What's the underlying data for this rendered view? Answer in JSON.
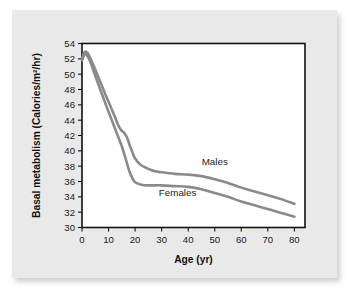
{
  "chart_data": {
    "type": "line",
    "title": "",
    "xlabel": "Age (yr)",
    "ylabel": "Basal metabolism (Calories/m²/hr)",
    "xlim": [
      0,
      84
    ],
    "ylim": [
      30,
      54
    ],
    "xticks": [
      0,
      10,
      20,
      30,
      40,
      50,
      60,
      70,
      80
    ],
    "yticks": [
      30,
      32,
      34,
      36,
      38,
      40,
      42,
      44,
      46,
      48,
      50,
      52,
      54
    ],
    "grid": false,
    "legend_position": "inline-annotation",
    "series": [
      {
        "name": "Males",
        "color": "#8a8a8a",
        "x": [
          0,
          1,
          2,
          3,
          5,
          7,
          9,
          11,
          13,
          14,
          15,
          16,
          17,
          18,
          19,
          20,
          22,
          24,
          26,
          28,
          30,
          35,
          40,
          45,
          50,
          55,
          60,
          65,
          70,
          75,
          80
        ],
        "values": [
          52.0,
          52.9,
          52.8,
          52.2,
          50.6,
          48.9,
          47.2,
          45.6,
          43.9,
          43.1,
          42.6,
          42.3,
          41.7,
          40.7,
          39.8,
          39.0,
          38.2,
          37.8,
          37.5,
          37.3,
          37.2,
          37.0,
          36.9,
          36.7,
          36.3,
          35.8,
          35.2,
          34.7,
          34.2,
          33.7,
          33.1
        ]
      },
      {
        "name": "Females",
        "color": "#8a8a8a",
        "x": [
          0,
          1,
          2,
          3,
          5,
          7,
          9,
          11,
          13,
          14,
          15,
          16,
          17,
          18,
          19,
          20,
          22,
          24,
          26,
          28,
          30,
          35,
          40,
          45,
          50,
          55,
          60,
          65,
          70,
          75,
          80
        ],
        "values": [
          51.8,
          52.6,
          52.4,
          51.7,
          49.8,
          47.9,
          46.0,
          44.2,
          42.4,
          41.5,
          40.6,
          39.5,
          38.3,
          37.2,
          36.4,
          35.9,
          35.6,
          35.5,
          35.5,
          35.5,
          35.5,
          35.4,
          35.3,
          35.0,
          34.5,
          34.0,
          33.4,
          32.9,
          32.4,
          31.9,
          31.4
        ]
      }
    ],
    "annotations": [
      {
        "text": "Males",
        "x": 50,
        "y": 38.1
      },
      {
        "text": "Females",
        "x": 36,
        "y": 34.1
      }
    ]
  }
}
